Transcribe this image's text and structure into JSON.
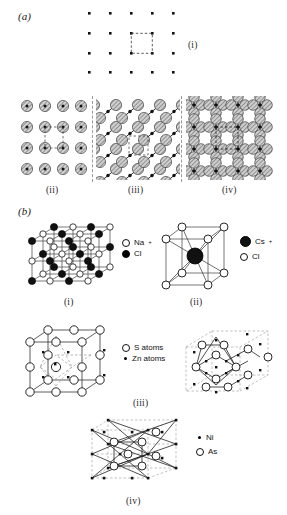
{
  "figure": {
    "part_a_label": "(a)",
    "part_b_label": "(b)",
    "panel_labels": {
      "a_i": "(i)",
      "a_ii": "(ii)",
      "a_iii": "(iii)",
      "a_iv": "(iv)",
      "b_i": "(i)",
      "b_ii": "(ii)",
      "b_iii": "(iii)",
      "b_iv": "(iv)"
    }
  },
  "legends": {
    "nacl": [
      {
        "symbol": "open-circle",
        "label": "Na",
        "charge": "+"
      },
      {
        "symbol": "filled-circle",
        "label": "Cl",
        "charge": "-"
      }
    ],
    "cscl": [
      {
        "symbol": "large-filled-circle",
        "label": "Cs",
        "charge": "+"
      },
      {
        "symbol": "open-circle",
        "label": "Cl",
        "charge": "-"
      }
    ],
    "zns": [
      {
        "symbol": "open-circle",
        "label": "S atoms",
        "charge": ""
      },
      {
        "symbol": "small-dot",
        "label": "Zn atoms",
        "charge": ""
      }
    ],
    "nias": [
      {
        "symbol": "small-dot",
        "label": "Ni",
        "charge": ""
      },
      {
        "symbol": "open-circle",
        "label": "As",
        "charge": ""
      }
    ]
  },
  "panel_a": {
    "i": {
      "description": "square-lattice-points",
      "columns": 5,
      "rows": 4,
      "unit_cell": "dashed-square"
    },
    "ii": {
      "description": "hatched-spheres-square-array",
      "columns": 4,
      "rows": 4,
      "unit_cell": "dashed-square"
    },
    "iii": {
      "description": "diagonal-chains-of-spheres",
      "unit_cell": "dashed-square"
    },
    "iv": {
      "description": "sphere-clusters-rows",
      "unit_cell": "dashed-rectangle"
    }
  },
  "panel_b": {
    "i": {
      "structure": "rock-salt",
      "grid": 3
    },
    "ii": {
      "structure": "caesium-chloride",
      "grid": 1
    },
    "iii": {
      "structure": "zinc-blende",
      "views": 2
    },
    "iv": {
      "structure": "nickel-arsenide",
      "views": 1
    }
  },
  "colors": {
    "ink": "#111111",
    "sphere_fill": "#c9c9c9",
    "sphere_edge": "#4a4a4a",
    "dashed": "#8a8a8a",
    "background": "#ffffff"
  }
}
